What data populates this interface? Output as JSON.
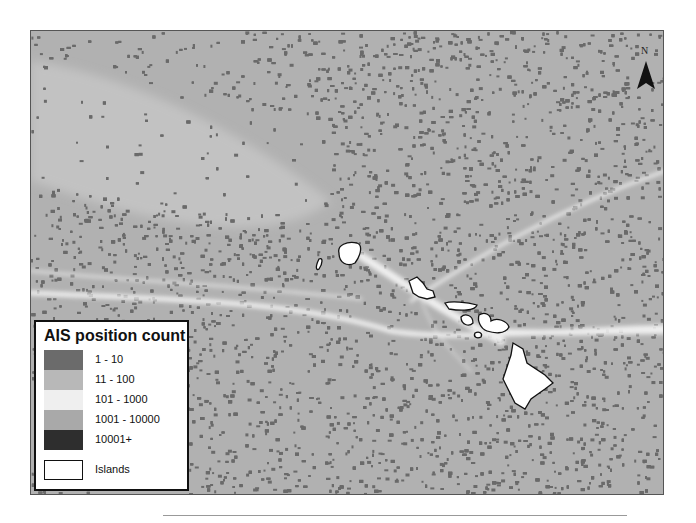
{
  "map": {
    "title": "AIS position count map — Hawaiian Islands",
    "background_color": "#b4b4b4",
    "north_arrow": {
      "label": "N",
      "icon": "north-arrow-icon"
    },
    "legend": {
      "title": "AIS position count",
      "items": [
        {
          "label": "1 - 10",
          "color": "#6b6b6b"
        },
        {
          "label": "11 - 100",
          "color": "#b8b8b8"
        },
        {
          "label": "101 - 1000",
          "color": "#efefef"
        },
        {
          "label": "1001 - 10000",
          "color": "#a9a9a9"
        },
        {
          "label": "10001+",
          "color": "#2e2e2e"
        },
        {
          "label": "Islands",
          "color": "#ffffff",
          "outlined": true
        }
      ]
    },
    "features": {
      "islands": [
        "Kauai",
        "Niihau",
        "Oahu",
        "Molokai",
        "Lanai",
        "Maui",
        "Kahoolawe",
        "Hawaii"
      ]
    }
  }
}
